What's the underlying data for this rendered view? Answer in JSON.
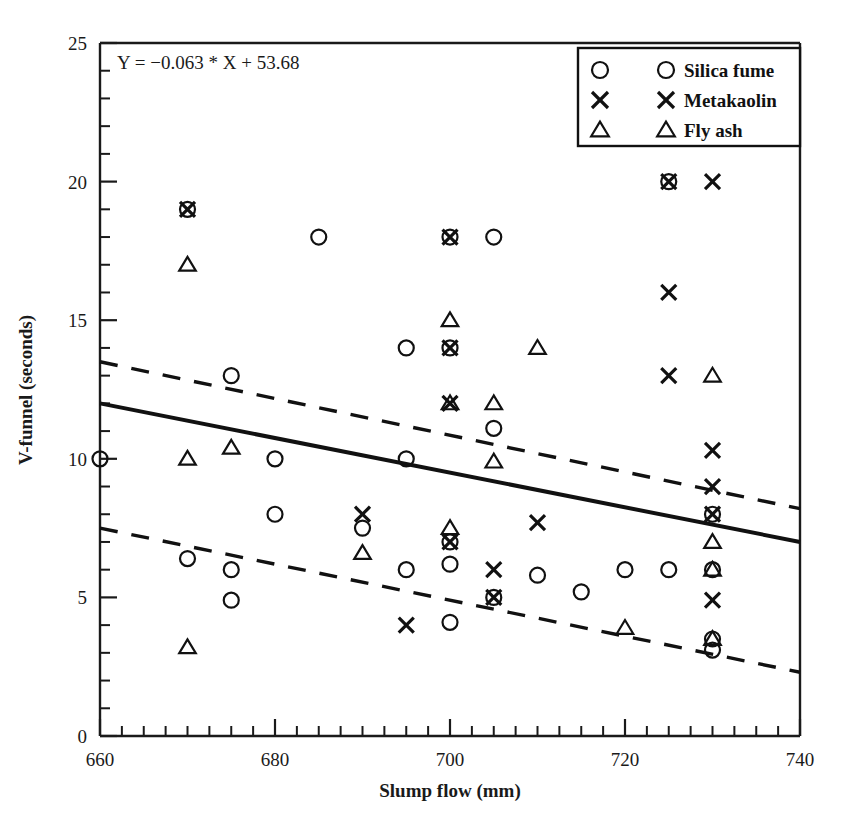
{
  "chart_data": {
    "type": "scatter",
    "title": "",
    "xlabel": "Slump flow (mm)",
    "ylabel": "V-funnel (seconds)",
    "xlim": [
      660,
      740
    ],
    "ylim": [
      0,
      25
    ],
    "xticks": [
      660,
      680,
      700,
      720,
      740
    ],
    "yticks": [
      0,
      5,
      10,
      15,
      20,
      25
    ],
    "x_minor_step": 2.5,
    "y_minor_step": 1,
    "grid": false,
    "annotation": "Y = −0.063 * X + 53.68",
    "legend_position": "top-right",
    "legend_entries": [
      {
        "label": "Silica fume",
        "marker": "circle"
      },
      {
        "label": "Metakaolin",
        "marker": "cross"
      },
      {
        "label": "Fly ash",
        "marker": "triangle"
      }
    ],
    "series": [
      {
        "name": "Silica fume",
        "marker": "circle",
        "points": [
          [
            660,
            10.0
          ],
          [
            670,
            19.0
          ],
          [
            670,
            6.4
          ],
          [
            675,
            13.0
          ],
          [
            675,
            6.0
          ],
          [
            675,
            4.9
          ],
          [
            680,
            10.0
          ],
          [
            680,
            8.0
          ],
          [
            685,
            18.0
          ],
          [
            690,
            7.5
          ],
          [
            695,
            14.0
          ],
          [
            695,
            10.0
          ],
          [
            695,
            6.0
          ],
          [
            700,
            18.0
          ],
          [
            700,
            7.0
          ],
          [
            700,
            6.2
          ],
          [
            700,
            4.1
          ],
          [
            700,
            14.0
          ],
          [
            705,
            18.0
          ],
          [
            705,
            11.1
          ],
          [
            705,
            5.0
          ],
          [
            710,
            5.8
          ],
          [
            715,
            5.2
          ],
          [
            720,
            6.0
          ],
          [
            725,
            6.0
          ],
          [
            725,
            20.0
          ],
          [
            730,
            8.0
          ],
          [
            730,
            6.0
          ],
          [
            730,
            3.5
          ],
          [
            730,
            3.1
          ]
        ]
      },
      {
        "name": "Metakaolin",
        "marker": "cross",
        "points": [
          [
            670,
            19.0
          ],
          [
            690,
            8.0
          ],
          [
            695,
            4.0
          ],
          [
            700,
            18.0
          ],
          [
            700,
            14.0
          ],
          [
            700,
            12.0
          ],
          [
            700,
            7.0
          ],
          [
            705,
            6.0
          ],
          [
            705,
            5.0
          ],
          [
            710,
            7.7
          ],
          [
            725,
            20.0
          ],
          [
            725,
            16.0
          ],
          [
            725,
            13.0
          ],
          [
            730,
            20.0
          ],
          [
            730,
            10.3
          ],
          [
            730,
            9.0
          ],
          [
            730,
            8.0
          ],
          [
            730,
            4.9
          ]
        ]
      },
      {
        "name": "Fly ash",
        "marker": "triangle",
        "points": [
          [
            670,
            17.0
          ],
          [
            670,
            10.0
          ],
          [
            670,
            3.2
          ],
          [
            675,
            10.4
          ],
          [
            690,
            6.6
          ],
          [
            700,
            15.0
          ],
          [
            700,
            12.0
          ],
          [
            700,
            7.5
          ],
          [
            705,
            12.0
          ],
          [
            705,
            9.9
          ],
          [
            710,
            14.0
          ],
          [
            720,
            3.9
          ],
          [
            730,
            13.0
          ],
          [
            730,
            7.0
          ],
          [
            730,
            6.0
          ],
          [
            730,
            3.5
          ]
        ]
      }
    ],
    "fit_lines": [
      {
        "name": "regression",
        "style": "solid",
        "x": [
          660,
          740
        ],
        "y": [
          12.0,
          7.0
        ]
      },
      {
        "name": "upper-confidence",
        "style": "dashed",
        "x": [
          660,
          740
        ],
        "y": [
          13.5,
          8.2
        ]
      },
      {
        "name": "lower-confidence",
        "style": "dashed",
        "x": [
          660,
          740
        ],
        "y": [
          7.5,
          2.3
        ]
      }
    ]
  }
}
